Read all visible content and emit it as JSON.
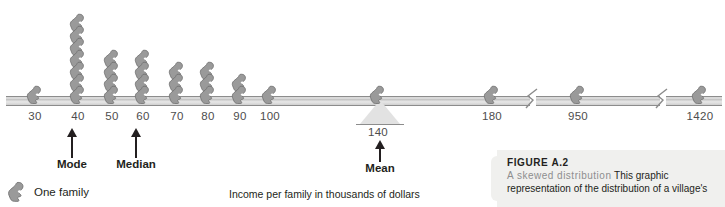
{
  "figure": {
    "number_label": "FIGURE A.2",
    "lead_in": "A skewed distribution",
    "body": "This graphic representation of the distribution of a village's",
    "axis_title": "Income per family in thousands of dollars"
  },
  "legend": {
    "icon": "person-icon",
    "label": "One family"
  },
  "markers": [
    {
      "name": "mode",
      "label": "Mode",
      "value": "40"
    },
    {
      "name": "median",
      "label": "Median",
      "value": "60"
    },
    {
      "name": "mean",
      "label": "Mean",
      "value": "140"
    }
  ],
  "axis": {
    "tick_labels": [
      "30",
      "40",
      "50",
      "60",
      "70",
      "80",
      "90",
      "100",
      "140",
      "180",
      "950",
      "1420"
    ],
    "breaks": 2,
    "color": "#d9d9d9",
    "stroke": "#8c8c8c"
  },
  "chart_data": {
    "type": "bar",
    "title": "A skewed distribution",
    "subtitle": "FIGURE A.2",
    "xlabel": "Income per family in thousands of dollars",
    "ylabel": "Number of families",
    "unit": "one pictogram = one family",
    "categories": [
      "30",
      "40",
      "50",
      "60",
      "70",
      "80",
      "90",
      "100",
      "140",
      "180",
      "950",
      "1420"
    ],
    "values": [
      1,
      7,
      4,
      4,
      3,
      3,
      2,
      1,
      1,
      1,
      1,
      1
    ],
    "annotations": [
      {
        "label": "Mode",
        "at": "40",
        "note": "most frequent value"
      },
      {
        "label": "Median",
        "at": "60",
        "note": "middle value"
      },
      {
        "label": "Mean",
        "at": "140",
        "note": "balance point / fulcrum"
      }
    ],
    "axis_breaks_after": [
      "180",
      "950"
    ],
    "grid": false,
    "legend": "bottom-left"
  },
  "colors": {
    "figure_fill": "#9a9a9a",
    "figure_stroke": "#6e6e6e",
    "axis_fill": "#d9d9d9",
    "text": "#231f20",
    "muted_text": "#4d4d4d",
    "caption_bg": "#f0f0ee",
    "caption_lead": "#8e8e8e"
  }
}
